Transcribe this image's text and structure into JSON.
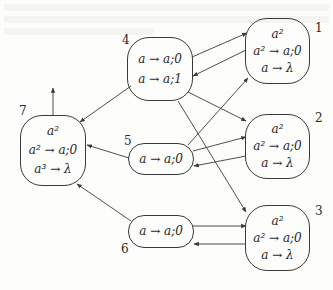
{
  "diagram": {
    "type": "state-transition-graph",
    "colors": {
      "line": "#3a3a3a",
      "background": "#fdfdfb",
      "text": "#2a2a2a"
    },
    "nodes": [
      {
        "id": "1",
        "label": "1",
        "lines": [
          "a²",
          "a² → a;0",
          "a → λ"
        ]
      },
      {
        "id": "2",
        "label": "2",
        "lines": [
          "a²",
          "a² → a;0",
          "a → λ"
        ]
      },
      {
        "id": "3",
        "label": "3",
        "lines": [
          "a²",
          "a² → a;0",
          "a → λ"
        ]
      },
      {
        "id": "4",
        "label": "4",
        "lines": [
          "a → a;0",
          "a → a;1"
        ]
      },
      {
        "id": "5",
        "label": "5",
        "lines": [
          "a → a;0"
        ]
      },
      {
        "id": "6",
        "label": "6",
        "lines": [
          "a → a;0"
        ]
      },
      {
        "id": "7",
        "label": "7",
        "lines": [
          "a²",
          "a² → a;0",
          "a³ → λ"
        ]
      }
    ],
    "edges": [
      {
        "from": "4",
        "to": "1"
      },
      {
        "from": "1",
        "to": "4"
      },
      {
        "from": "4",
        "to": "2"
      },
      {
        "from": "4",
        "to": "3"
      },
      {
        "from": "4",
        "to": "7"
      },
      {
        "from": "5",
        "to": "1"
      },
      {
        "from": "5",
        "to": "2"
      },
      {
        "from": "2",
        "to": "5"
      },
      {
        "from": "5",
        "to": "7"
      },
      {
        "from": "6",
        "to": "3"
      },
      {
        "from": "3",
        "to": "6"
      },
      {
        "from": "6",
        "to": "7"
      },
      {
        "from": "7",
        "to": "environment"
      }
    ]
  }
}
